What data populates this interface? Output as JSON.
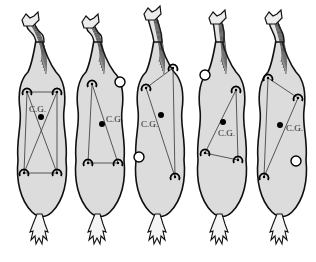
{
  "figure": {
    "cg_label": "C.G.",
    "colors": {
      "body_fill": "#dcdcdc",
      "outline": "#111111",
      "background": "#ffffff"
    },
    "horses": [
      {
        "id": 1,
        "supporting_feet": [
          "left-fore",
          "right-fore",
          "left-hind",
          "right-hind"
        ],
        "lifted_feet": [],
        "support_shape": "crossed-quadrilateral",
        "cg_label": "C.G."
      },
      {
        "id": 2,
        "supporting_feet": [
          "left-fore",
          "left-hind",
          "right-hind"
        ],
        "lifted_feet": [
          "right-fore"
        ],
        "support_shape": "triangle",
        "cg_label": "C.G."
      },
      {
        "id": 3,
        "supporting_feet": [
          "left-fore",
          "right-fore",
          "right-hind"
        ],
        "lifted_feet": [
          "left-hind"
        ],
        "support_shape": "triangle",
        "cg_label": "C.G."
      },
      {
        "id": 4,
        "supporting_feet": [
          "right-fore",
          "left-hind",
          "right-hind"
        ],
        "lifted_feet": [
          "left-fore"
        ],
        "support_shape": "triangle",
        "cg_label": "C.G."
      },
      {
        "id": 5,
        "supporting_feet": [
          "left-fore",
          "right-fore",
          "left-hind"
        ],
        "lifted_feet": [
          "right-hind"
        ],
        "support_shape": "triangle",
        "cg_label": "C.G."
      }
    ]
  }
}
